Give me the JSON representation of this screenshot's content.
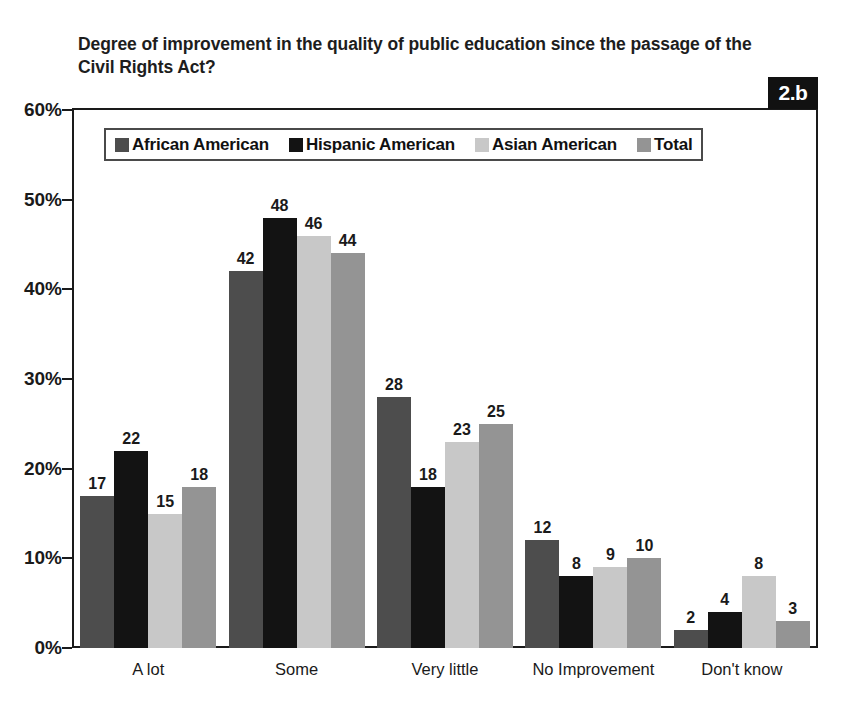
{
  "figure": {
    "badge_label": "2.b",
    "title": "Degree of improvement in the quality of public education since the passage of the Civil Rights Act?"
  },
  "chart_data": {
    "type": "bar",
    "title": "Degree of improvement in the quality of public education since the passage of the Civil Rights Act?",
    "xlabel": "",
    "ylabel": "",
    "ylim": [
      0,
      60
    ],
    "y_ticks": [
      0,
      10,
      20,
      30,
      40,
      50,
      60
    ],
    "y_tick_labels": [
      "0%",
      "10%",
      "20%",
      "30%",
      "40%",
      "50%",
      "60%"
    ],
    "grid": false,
    "legend_position": "top-left-inside",
    "value_labels": true,
    "categories": [
      "A lot",
      "Some",
      "Very little",
      "No Improvement",
      "Don't know"
    ],
    "series": [
      {
        "name": "African American",
        "color": "#4d4d4d",
        "values": [
          17,
          42,
          28,
          12,
          2
        ]
      },
      {
        "name": "Hispanic American",
        "color": "#131313",
        "values": [
          22,
          48,
          18,
          8,
          4
        ]
      },
      {
        "name": "Asian American",
        "color": "#c8c8c8",
        "values": [
          15,
          46,
          23,
          9,
          8
        ]
      },
      {
        "name": "Total",
        "color": "#949494",
        "values": [
          18,
          44,
          25,
          10,
          3
        ]
      }
    ]
  },
  "colors": {
    "axis": "#1a1a1a",
    "text": "#1a1a1a",
    "badge_background": "#111111",
    "badge_text": "#ffffff",
    "plot_background": "#ffffff"
  }
}
